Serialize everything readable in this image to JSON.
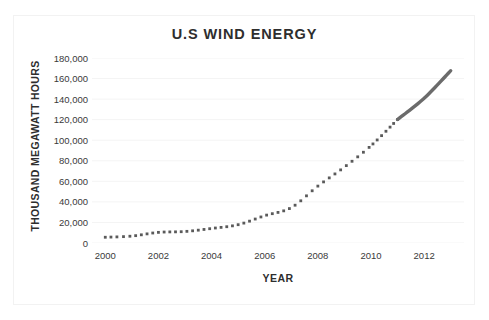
{
  "chart_data": {
    "type": "line",
    "title": "U.S WIND ENERGY",
    "xlabel": "YEAR",
    "ylabel": "THOUSAND MEGAWATT HOURS",
    "xlim": [
      1999.5,
      2013.5
    ],
    "ylim": [
      0,
      180000
    ],
    "grid": true,
    "grid_axis": "y",
    "legend": "none",
    "y_ticks": [
      0,
      20000,
      40000,
      60000,
      80000,
      100000,
      120000,
      140000,
      160000,
      180000
    ],
    "y_tick_labels": [
      "0",
      "20,000",
      "40,000",
      "60,000",
      "80,000",
      "100,000",
      "120,000",
      "140,000",
      "160,000",
      "180,000"
    ],
    "x_ticks": [
      2000,
      2002,
      2004,
      2006,
      2008,
      2010,
      2012
    ],
    "x_tick_labels": [
      "2000",
      "2002",
      "2004",
      "2006",
      "2008",
      "2010",
      "2012"
    ],
    "series": [
      {
        "name": "U.S Wind Energy Generation",
        "style": "dotted",
        "color": "#5a5a5a",
        "x": [
          2000,
          2001,
          2002,
          2003,
          2004,
          2005,
          2006,
          2007,
          2008,
          2009,
          2010,
          2011
        ],
        "values": [
          5593,
          6737,
          10354,
          11187,
          14144,
          17811,
          26589,
          34450,
          55363,
          73886,
          94652,
          120177
        ]
      },
      {
        "name": "U.S Wind Energy Generation (recent)",
        "style": "solid",
        "color": "#6b6b6b",
        "x": [
          2011,
          2012,
          2013
        ],
        "values": [
          120177,
          140822,
          167665
        ]
      }
    ],
    "transition_year": 2011,
    "transition_value": 120177,
    "end_year": 2013,
    "end_value": 167665
  }
}
